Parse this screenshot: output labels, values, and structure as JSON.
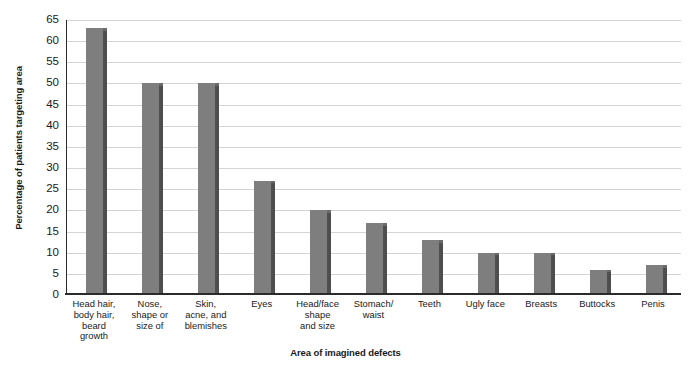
{
  "chart_data": {
    "type": "bar",
    "title": "",
    "xlabel": "Area of imagined defects",
    "ylabel": "Percentage of patients targeting area",
    "ylim": [
      0,
      65
    ],
    "ytick_step": 5,
    "yticks": [
      "0",
      "5",
      "10",
      "15",
      "20",
      "25",
      "30",
      "35",
      "40",
      "45",
      "50",
      "55",
      "60",
      "65"
    ],
    "grid": true,
    "legend": false,
    "bar_color": "#7e7e7e",
    "bar_edge_color": "#4e4e4e",
    "gridline_color": "#d4d4d4",
    "axis_color": "#2b2b2b",
    "background": "#ffffff",
    "categories": [
      "Head hair, body hair, beard growth",
      "Nose, shape or size of",
      "Skin, acne, and blemishes",
      "Eyes",
      "Head/face shape and size",
      "Stomach/ waist",
      "Teeth",
      "Ugly face",
      "Breasts",
      "Buttocks",
      "Penis"
    ],
    "category_lines": [
      [
        "Head hair,",
        "body hair,",
        "beard",
        "growth"
      ],
      [
        "Nose,",
        "shape or",
        "size of"
      ],
      [
        "Skin,",
        "acne, and",
        "blemishes"
      ],
      [
        "Eyes"
      ],
      [
        "Head/face",
        "shape",
        "and size"
      ],
      [
        "Stomach/",
        "waist"
      ],
      [
        "Teeth"
      ],
      [
        "Ugly face"
      ],
      [
        "Breasts"
      ],
      [
        "Buttocks"
      ],
      [
        "Penis"
      ]
    ],
    "values": [
      63,
      50,
      50,
      27,
      20,
      17,
      13,
      10,
      10,
      6,
      7
    ]
  }
}
